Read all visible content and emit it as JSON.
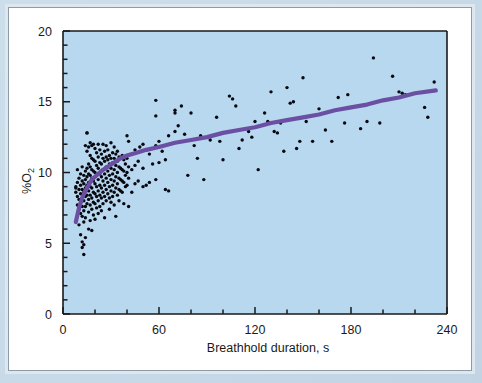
{
  "figure": {
    "plot_bg_color": "#b8d8ef",
    "axis_color": "#1a1a1a",
    "point_color": "#080810",
    "curve_color": "#6b4fa3",
    "frame_color": "#8e9aa6",
    "page_bg_color": "#c5d8e8"
  },
  "chart_data": {
    "type": "scatter",
    "title": "",
    "xlabel": "Breathhold duration, s",
    "ylabel": "%O2",
    "ylabel_text": "%O",
    "ylabel_sub": "2",
    "xlim": [
      0,
      240
    ],
    "ylim": [
      0,
      20
    ],
    "xticks": [
      0,
      60,
      120,
      180,
      240
    ],
    "yticks": [
      0,
      5,
      10,
      15,
      20
    ],
    "xtick_labels": [
      "0",
      "60",
      "120",
      "180",
      "240"
    ],
    "ytick_labels": [
      "0",
      "5",
      "10",
      "15",
      "20"
    ],
    "x_minor_step": 20,
    "y_minor_step": 1,
    "grid": false,
    "legend": null,
    "series": [
      {
        "name": "Observations",
        "marker": "circle",
        "color": "#080810",
        "points": [
          [
            8,
            8.9
          ],
          [
            8,
            8.6
          ],
          [
            8,
            9.0
          ],
          [
            9,
            9.3
          ],
          [
            9,
            8.3
          ],
          [
            9,
            7.7
          ],
          [
            9,
            10.2
          ],
          [
            10,
            9.6
          ],
          [
            10,
            8.8
          ],
          [
            10,
            8.1
          ],
          [
            10,
            7.4
          ],
          [
            10,
            6.3
          ],
          [
            11,
            9.9
          ],
          [
            11,
            9.1
          ],
          [
            11,
            8.5
          ],
          [
            11,
            7.9
          ],
          [
            11,
            7.1
          ],
          [
            11,
            5.6
          ],
          [
            12,
            10.4
          ],
          [
            12,
            9.4
          ],
          [
            12,
            8.8
          ],
          [
            12,
            8.2
          ],
          [
            12,
            7.6
          ],
          [
            12,
            6.9
          ],
          [
            12,
            5.1
          ],
          [
            12,
            4.7
          ],
          [
            13,
            9.8
          ],
          [
            13,
            9.2
          ],
          [
            13,
            8.6
          ],
          [
            13,
            8.0
          ],
          [
            13,
            7.3
          ],
          [
            13,
            6.5
          ],
          [
            13,
            4.9
          ],
          [
            13,
            4.2
          ],
          [
            14,
            11.9
          ],
          [
            14,
            10.1
          ],
          [
            14,
            9.5
          ],
          [
            14,
            8.9
          ],
          [
            14,
            8.3
          ],
          [
            14,
            7.6
          ],
          [
            14,
            6.8
          ],
          [
            14,
            5.4
          ],
          [
            15,
            12.8
          ],
          [
            15,
            12.8
          ],
          [
            15,
            11.5
          ],
          [
            15,
            10.3
          ],
          [
            15,
            9.7
          ],
          [
            15,
            9.1
          ],
          [
            15,
            8.4
          ],
          [
            15,
            7.8
          ],
          [
            16,
            11.8
          ],
          [
            16,
            10.6
          ],
          [
            16,
            9.9
          ],
          [
            16,
            9.3
          ],
          [
            16,
            8.7
          ],
          [
            16,
            8.1
          ],
          [
            16,
            7.2
          ],
          [
            16,
            6.0
          ],
          [
            17,
            12.1
          ],
          [
            17,
            11.2
          ],
          [
            17,
            10.4
          ],
          [
            17,
            9.8
          ],
          [
            17,
            9.0
          ],
          [
            17,
            8.4
          ],
          [
            17,
            7.7
          ],
          [
            17,
            6.6
          ],
          [
            18,
            11.9
          ],
          [
            18,
            11.0
          ],
          [
            18,
            10.2
          ],
          [
            18,
            9.6
          ],
          [
            18,
            8.9
          ],
          [
            18,
            8.2
          ],
          [
            18,
            7.4
          ],
          [
            18,
            5.9
          ],
          [
            19,
            12.0
          ],
          [
            19,
            10.9
          ],
          [
            19,
            10.1
          ],
          [
            19,
            9.4
          ],
          [
            19,
            8.6
          ],
          [
            19,
            7.9
          ],
          [
            19,
            7.0
          ],
          [
            20,
            11.7
          ],
          [
            20,
            10.8
          ],
          [
            20,
            10.0
          ],
          [
            20,
            9.2
          ],
          [
            20,
            8.5
          ],
          [
            20,
            7.8
          ],
          [
            20,
            6.7
          ],
          [
            21,
            11.4
          ],
          [
            21,
            10.5
          ],
          [
            21,
            9.8
          ],
          [
            21,
            9.0
          ],
          [
            21,
            8.3
          ],
          [
            21,
            7.5
          ],
          [
            22,
            12.0
          ],
          [
            22,
            11.1
          ],
          [
            22,
            10.3
          ],
          [
            22,
            9.5
          ],
          [
            22,
            8.7
          ],
          [
            22,
            8.0
          ],
          [
            22,
            7.1
          ],
          [
            23,
            11.6
          ],
          [
            23,
            10.7
          ],
          [
            23,
            9.9
          ],
          [
            23,
            9.1
          ],
          [
            23,
            8.4
          ],
          [
            23,
            7.6
          ],
          [
            24,
            11.3
          ],
          [
            24,
            10.6
          ],
          [
            24,
            9.7
          ],
          [
            24,
            8.9
          ],
          [
            24,
            8.2
          ],
          [
            24,
            7.3
          ],
          [
            25,
            12.0
          ],
          [
            25,
            11.0
          ],
          [
            25,
            10.2
          ],
          [
            25,
            9.4
          ],
          [
            25,
            8.6
          ],
          [
            25,
            7.8
          ],
          [
            26,
            11.5
          ],
          [
            26,
            10.8
          ],
          [
            26,
            9.9
          ],
          [
            26,
            9.1
          ],
          [
            26,
            8.3
          ],
          [
            26,
            6.8
          ],
          [
            27,
            11.9
          ],
          [
            27,
            11.1
          ],
          [
            27,
            10.4
          ],
          [
            27,
            9.6
          ],
          [
            27,
            8.8
          ],
          [
            27,
            8.0
          ],
          [
            28,
            11.6
          ],
          [
            28,
            10.9
          ],
          [
            28,
            10.1
          ],
          [
            28,
            9.3
          ],
          [
            28,
            8.5
          ],
          [
            29,
            11.2
          ],
          [
            29,
            10.6
          ],
          [
            29,
            9.8
          ],
          [
            29,
            9.0
          ],
          [
            29,
            8.2
          ],
          [
            29,
            7.4
          ],
          [
            30,
            12.1
          ],
          [
            30,
            11.0
          ],
          [
            30,
            10.3
          ],
          [
            30,
            9.5
          ],
          [
            30,
            8.7
          ],
          [
            30,
            7.9
          ],
          [
            31,
            11.4
          ],
          [
            31,
            10.7
          ],
          [
            31,
            9.9
          ],
          [
            31,
            9.1
          ],
          [
            31,
            8.3
          ],
          [
            32,
            11.8
          ],
          [
            32,
            11.0
          ],
          [
            32,
            10.2
          ],
          [
            32,
            9.4
          ],
          [
            32,
            8.6
          ],
          [
            32,
            7.7
          ],
          [
            33,
            11.3
          ],
          [
            33,
            10.5
          ],
          [
            33,
            9.7
          ],
          [
            33,
            8.9
          ],
          [
            33,
            6.9
          ],
          [
            34,
            11.5
          ],
          [
            34,
            10.8
          ],
          [
            34,
            10.0
          ],
          [
            34,
            9.2
          ],
          [
            34,
            8.4
          ],
          [
            35,
            11.1
          ],
          [
            35,
            10.4
          ],
          [
            35,
            9.6
          ],
          [
            35,
            8.8
          ],
          [
            35,
            8.0
          ],
          [
            36,
            11.0
          ],
          [
            36,
            10.3
          ],
          [
            36,
            9.5
          ],
          [
            36,
            8.7
          ],
          [
            37,
            11.2
          ],
          [
            37,
            10.2
          ],
          [
            37,
            9.4
          ],
          [
            37,
            8.6
          ],
          [
            38,
            10.9
          ],
          [
            38,
            10.1
          ],
          [
            38,
            9.3
          ],
          [
            38,
            7.8
          ],
          [
            39,
            10.6
          ],
          [
            39,
            9.8
          ],
          [
            39,
            9.0
          ],
          [
            40,
            12.6
          ],
          [
            40,
            11.0
          ],
          [
            40,
            10.0
          ],
          [
            40,
            9.1
          ],
          [
            41,
            12.2
          ],
          [
            41,
            10.4
          ],
          [
            41,
            9.6
          ],
          [
            41,
            7.6
          ],
          [
            43,
            11.3
          ],
          [
            43,
            10.2
          ],
          [
            43,
            8.6
          ],
          [
            45,
            11.6
          ],
          [
            45,
            10.5
          ],
          [
            45,
            9.2
          ],
          [
            47,
            10.8
          ],
          [
            47,
            9.4
          ],
          [
            48,
            11.8
          ],
          [
            50,
            12.0
          ],
          [
            50,
            10.3
          ],
          [
            50,
            9.0
          ],
          [
            52,
            9.1
          ],
          [
            54,
            11.3
          ],
          [
            54,
            9.3
          ],
          [
            56,
            10.6
          ],
          [
            58,
            15.1
          ],
          [
            58,
            14.0
          ],
          [
            58,
            11.9
          ],
          [
            58,
            9.5
          ],
          [
            60,
            12.2
          ],
          [
            60,
            10.7
          ],
          [
            62,
            11.5
          ],
          [
            64,
            10.9
          ],
          [
            64,
            8.8
          ],
          [
            66,
            12.6
          ],
          [
            66,
            8.7
          ],
          [
            70,
            14.2
          ],
          [
            70,
            14.4
          ],
          [
            70,
            12.9
          ],
          [
            72,
            13.3
          ],
          [
            74,
            14.7
          ],
          [
            76,
            12.7
          ],
          [
            78,
            9.8
          ],
          [
            80,
            14.2
          ],
          [
            82,
            11.9
          ],
          [
            84,
            11.0
          ],
          [
            86,
            12.6
          ],
          [
            88,
            9.5
          ],
          [
            92,
            12.3
          ],
          [
            96,
            13.9
          ],
          [
            98,
            12.2
          ],
          [
            100,
            10.9
          ],
          [
            104,
            15.4
          ],
          [
            106,
            15.2
          ],
          [
            108,
            14.7
          ],
          [
            110,
            11.7
          ],
          [
            112,
            12.3
          ],
          [
            114,
            13.1
          ],
          [
            116,
            12.9
          ],
          [
            118,
            12.5
          ],
          [
            120,
            13.6
          ],
          [
            122,
            10.2
          ],
          [
            126,
            14.2
          ],
          [
            128,
            13.6
          ],
          [
            130,
            15.7
          ],
          [
            132,
            12.9
          ],
          [
            134,
            12.8
          ],
          [
            136,
            13.5
          ],
          [
            138,
            11.5
          ],
          [
            140,
            16.0
          ],
          [
            142,
            14.9
          ],
          [
            144,
            15.0
          ],
          [
            146,
            11.7
          ],
          [
            148,
            12.2
          ],
          [
            150,
            16.7
          ],
          [
            152,
            13.6
          ],
          [
            156,
            12.2
          ],
          [
            160,
            14.5
          ],
          [
            164,
            13.0
          ],
          [
            168,
            12.2
          ],
          [
            172,
            15.3
          ],
          [
            176,
            13.5
          ],
          [
            178,
            15.5
          ],
          [
            186,
            13.1
          ],
          [
            190,
            13.6
          ],
          [
            194,
            18.1
          ],
          [
            198,
            13.5
          ],
          [
            206,
            16.8
          ],
          [
            210,
            15.7
          ],
          [
            212,
            15.6
          ],
          [
            214,
            15.5
          ],
          [
            226,
            14.6
          ],
          [
            228,
            13.9
          ],
          [
            232,
            16.4
          ]
        ]
      }
    ],
    "fit_curve": {
      "name": "Fitted logarithmic trend",
      "color": "#6b4fa3",
      "width_px": 4.2,
      "points": [
        [
          8,
          6.5
        ],
        [
          10,
          7.5
        ],
        [
          12,
          8.2
        ],
        [
          14,
          8.7
        ],
        [
          16,
          9.1
        ],
        [
          18,
          9.5
        ],
        [
          20,
          9.7
        ],
        [
          24,
          10.1
        ],
        [
          28,
          10.4
        ],
        [
          32,
          10.7
        ],
        [
          36,
          11.0
        ],
        [
          40,
          11.2
        ],
        [
          46,
          11.4
        ],
        [
          52,
          11.6
        ],
        [
          60,
          11.8
        ],
        [
          70,
          12.1
        ],
        [
          80,
          12.3
        ],
        [
          90,
          12.5
        ],
        [
          100,
          12.8
        ],
        [
          110,
          13.0
        ],
        [
          120,
          13.2
        ],
        [
          130,
          13.5
        ],
        [
          140,
          13.7
        ],
        [
          150,
          13.9
        ],
        [
          160,
          14.1
        ],
        [
          170,
          14.4
        ],
        [
          180,
          14.6
        ],
        [
          190,
          14.8
        ],
        [
          200,
          15.1
        ],
        [
          210,
          15.3
        ],
        [
          220,
          15.6
        ],
        [
          233,
          15.8
        ]
      ]
    }
  }
}
